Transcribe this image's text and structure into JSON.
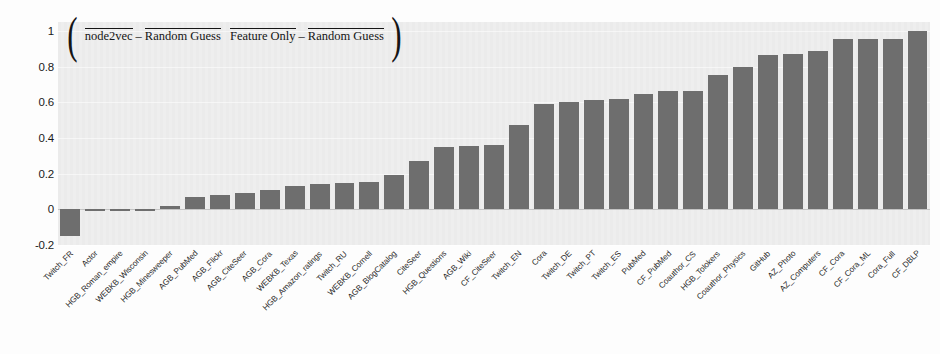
{
  "chart_data": {
    "type": "bar",
    "xlabel": "",
    "ylabel": "",
    "ylim": [
      -0.2,
      1.05
    ],
    "yticks": [
      "1",
      "0.8",
      "0.6",
      "0.4",
      "0.2",
      "0",
      "-0.2"
    ],
    "ytick_values": [
      1,
      0.8,
      0.6,
      0.4,
      0.2,
      0,
      -0.2
    ],
    "grid": true,
    "legend": "none",
    "bar_color": "#6e6e6e",
    "plot_background": "#eeeeee",
    "categories": [
      "Twitch_FR",
      "Actor",
      "HGB_Roman_empire",
      "WEBKB_Wisconsin",
      "HGB_Minesweeper",
      "AGB_PubMed",
      "AGB_Flickr",
      "AGB_CiteSeer",
      "AGB_Cora",
      "WEBKB_Texas",
      "HGB_Amazon_ratings",
      "Twitch_RU",
      "WEBKB_Cornell",
      "AGB_BlogCatalog",
      "CiteSeer",
      "HGB_Questions",
      "AGB_Wiki",
      "CF_CiteSeer",
      "Twitch_EN",
      "Cora",
      "Twitch_DE",
      "Twitch_PT",
      "Twitch_ES",
      "PubMed",
      "CF_PubMed",
      "Coauthor_CS",
      "HGB_Tolokers",
      "Coauthor_Physics",
      "GitHub",
      "AZ_Photo",
      "AZ_Computers",
      "CF_Cora",
      "CF_Cora_ML",
      "Cora_Full",
      "CF_DBLP"
    ],
    "values": [
      -0.15,
      -0.01,
      -0.005,
      -0.005,
      0.02,
      0.07,
      0.08,
      0.09,
      0.11,
      0.13,
      0.14,
      0.145,
      0.155,
      0.195,
      0.27,
      0.35,
      0.355,
      0.36,
      0.47,
      0.59,
      0.6,
      0.615,
      0.62,
      0.645,
      0.665,
      0.665,
      0.755,
      0.8,
      0.865,
      0.87,
      0.885,
      0.955,
      0.955,
      0.955,
      1.0
    ]
  },
  "title_formula": {
    "numerator_left": "node2vec",
    "minus": "–",
    "numerator_right": "Random Guess",
    "denominator_left": "Feature Only",
    "denominator_right": "Random Guess",
    "open_paren": "(",
    "close_paren": ")"
  }
}
